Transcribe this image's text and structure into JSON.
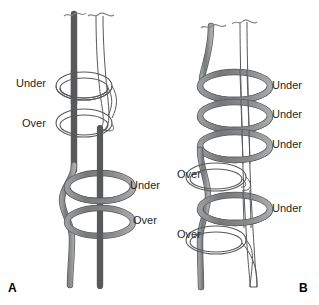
{
  "figure": {
    "background_color": "#ffffff",
    "width": 319,
    "height": 305,
    "strand_colors": {
      "dark_strand": "#808285",
      "dark_strand_outline": "#58595b",
      "light_strand_fill": "#ffffff",
      "light_strand_outline": "#58595b",
      "light_strand_shaded": "#d9dadb"
    },
    "text_color": "#231f20"
  },
  "panels": [
    {
      "id": "A",
      "letter": "A",
      "letter_x": 8,
      "letter_y": 281,
      "labels": [
        {
          "name": "label-a-under-1",
          "text": "Under",
          "x": 16,
          "y": 77,
          "align": "left"
        },
        {
          "name": "label-a-over-1",
          "text": "Over",
          "x": 22,
          "y": 117,
          "align": "left"
        },
        {
          "name": "label-a-under-2",
          "text": "Under",
          "x": 130,
          "y": 179,
          "align": "left"
        },
        {
          "name": "label-a-over-2",
          "text": "Over",
          "x": 133,
          "y": 214,
          "align": "left"
        }
      ]
    },
    {
      "id": "B",
      "letter": "B",
      "letter_x": 299,
      "letter_y": 281,
      "labels": [
        {
          "name": "label-b-under-1",
          "text": "Under",
          "x": 272,
          "y": 79,
          "align": "left"
        },
        {
          "name": "label-b-under-2",
          "text": "Under",
          "x": 272,
          "y": 108,
          "align": "left"
        },
        {
          "name": "label-b-under-3",
          "text": "Under",
          "x": 272,
          "y": 138,
          "align": "left"
        },
        {
          "name": "label-b-over-1",
          "text": "Over",
          "x": 177,
          "y": 168,
          "align": "left"
        },
        {
          "name": "label-b-under-4",
          "text": "Under",
          "x": 272,
          "y": 202,
          "align": "left"
        },
        {
          "name": "label-b-over-2",
          "text": "Over",
          "x": 177,
          "y": 228,
          "align": "left"
        }
      ]
    }
  ]
}
